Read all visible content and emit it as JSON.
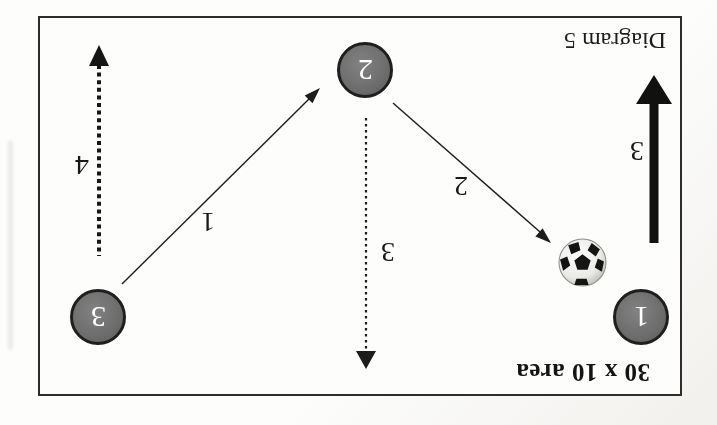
{
  "orientation": "page-scanned-upside-down",
  "title": "Diagram 5",
  "field": {
    "area_label": "30 x 10 area"
  },
  "players": [
    {
      "number": "1"
    },
    {
      "number": "2"
    },
    {
      "number": "3"
    }
  ],
  "moves": [
    {
      "label": "1",
      "style": "thin-solid-arrow",
      "from": "player-3",
      "to": "player-2"
    },
    {
      "label": "2",
      "style": "thin-solid-arrow",
      "from": "player-2",
      "to": "ball"
    },
    {
      "label": "3",
      "style": "dotted-arrow",
      "from": "player-2",
      "to": "bottom"
    },
    {
      "label": "3",
      "style": "thick-solid-arrow",
      "near": "player-1-flank"
    },
    {
      "label": "4",
      "style": "dotted-arrow",
      "from": "player-3",
      "to": "top"
    }
  ],
  "icons": {
    "ball": "soccer-ball"
  },
  "colors": {
    "ink": "#1a1a1a",
    "player_fill": "#6b6b6b",
    "player_border": "#1f1f1f",
    "player_number": "#ffffff",
    "field_border": "#2d2d2d",
    "page_background": "#fdfdfc"
  }
}
